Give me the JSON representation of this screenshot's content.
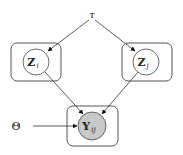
{
  "diagram": {
    "type": "graphical-model",
    "nodes": {
      "tau": {
        "label": "τ",
        "kind": "hyperparameter"
      },
      "theta": {
        "label": "Θ",
        "kind": "parameter"
      },
      "z_i": {
        "label": "Z",
        "subscript": "i",
        "kind": "latent",
        "fill": "#ffffff"
      },
      "z_j": {
        "label": "Z",
        "subscript": "j",
        "kind": "latent",
        "fill": "#ffffff"
      },
      "y_ij": {
        "label": "Y",
        "subscript": "ij",
        "kind": "observed",
        "fill": "#c8c8c8"
      }
    },
    "edges": [
      {
        "from": "tau",
        "to": "z_i"
      },
      {
        "from": "tau",
        "to": "z_j"
      },
      {
        "from": "z_i",
        "to": "y_ij"
      },
      {
        "from": "z_j",
        "to": "y_ij"
      },
      {
        "from": "theta",
        "to": "y_ij"
      }
    ],
    "plates": [
      {
        "contains": "z_i"
      },
      {
        "contains": "z_j"
      },
      {
        "contains": "y_ij"
      }
    ],
    "colors": {
      "stroke": "#333333",
      "observed_fill": "#c8c8c8",
      "plate_stroke": "#555555"
    }
  }
}
